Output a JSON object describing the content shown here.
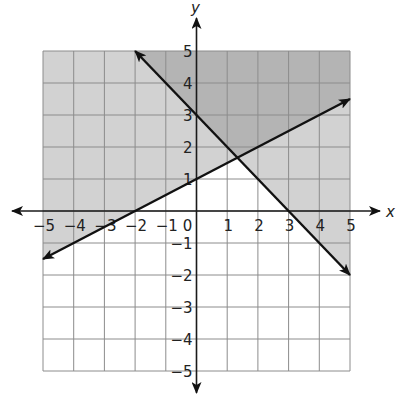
{
  "chart_data": {
    "type": "line",
    "title": "",
    "subtitle": "Graph of a system of linear inequalities",
    "xlabel": "x",
    "ylabel": "y",
    "xlim": [
      -5,
      5
    ],
    "ylim": [
      -5,
      5
    ],
    "grid": true,
    "legend": null,
    "x_ticks": [
      -5,
      -4,
      -3,
      -2,
      -1,
      0,
      1,
      2,
      3,
      4,
      5
    ],
    "y_ticks": [
      -5,
      -4,
      -3,
      -2,
      -1,
      1,
      2,
      3,
      4,
      5
    ],
    "series": [
      {
        "name": "Line 1: y = -x + 3",
        "slope": -1,
        "intercept": 3,
        "points": [
          [
            -2,
            5
          ],
          [
            0,
            3
          ],
          [
            3,
            0
          ],
          [
            5,
            -2
          ]
        ],
        "arrows": "both",
        "shaded_side": "above"
      },
      {
        "name": "Line 2: y = 0.5x + 1",
        "slope": 0.5,
        "intercept": 1,
        "points": [
          [
            -5,
            -1.5
          ],
          [
            -2,
            0
          ],
          [
            0,
            1
          ],
          [
            5,
            3.5
          ]
        ],
        "arrows": "both",
        "shaded_side": "above"
      }
    ],
    "intersection": [
      1.33,
      1.67
    ],
    "shading": {
      "single_region_color": "#d2d2d2",
      "overlap_region_color": "#b4b4b4",
      "unshaded_color": "#ffffff",
      "description": "Light gray above either line; darker gray where both half-planes overlap; white below both lines"
    }
  },
  "axes": {
    "x_label": "x",
    "y_label": "y",
    "zero_label": "0"
  },
  "colors": {
    "grid_line": "#8c8c8c",
    "axis": "#1a1a1a",
    "line": "#111111",
    "light_shade": "#d2d2d2",
    "dark_shade": "#b4b4b4"
  }
}
